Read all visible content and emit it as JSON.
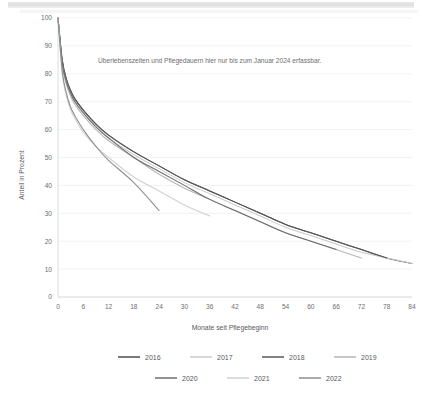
{
  "chart_data": {
    "type": "line",
    "title": "",
    "xlabel": "Monate seit Pflegebeginn",
    "ylabel": "Anteil in Prozent",
    "xlim": [
      0,
      84
    ],
    "ylim": [
      0,
      100
    ],
    "xticks": [
      0,
      6,
      12,
      18,
      24,
      30,
      36,
      42,
      48,
      54,
      60,
      66,
      72,
      78,
      84
    ],
    "yticks": [
      0,
      10,
      20,
      30,
      40,
      50,
      60,
      70,
      80,
      90,
      100
    ],
    "grid": "horizontal",
    "legend_position": "bottom",
    "annotations": [
      {
        "text": "Überlebenszeiten und Pflegedauern hier nur bis zum Januar 2024 erfassbar.",
        "x": 36,
        "y": 84
      }
    ],
    "x": [
      0,
      1,
      2,
      3,
      4,
      6,
      9,
      12,
      18,
      24,
      30,
      36,
      42,
      48,
      54,
      60,
      66,
      72,
      78,
      84
    ],
    "series": [
      {
        "name": "2016",
        "color": "#4c4c4e",
        "x_end": 84,
        "values": [
          100,
          85,
          78,
          74,
          71,
          67,
          62,
          58,
          52,
          47,
          42,
          38,
          34,
          30,
          26,
          23,
          20,
          17,
          14,
          12
        ]
      },
      {
        "name": "2017",
        "color": "#c9cacb",
        "x_end": 84,
        "values": [
          100,
          84,
          77,
          73,
          70,
          66,
          61,
          57,
          51,
          46,
          41,
          37,
          33,
          29,
          25,
          22,
          19,
          16,
          14,
          12
        ]
      },
      {
        "name": "2018",
        "color": "#58595b",
        "x_end": 78,
        "values": [
          100,
          85,
          78,
          74,
          71,
          67,
          62,
          58,
          52,
          47,
          42,
          38,
          34,
          30,
          26,
          23,
          20,
          17,
          14,
          null
        ]
      },
      {
        "name": "2019",
        "color": "#b5b6b8",
        "x_end": 72,
        "values": [
          100,
          83,
          76,
          72,
          69,
          65,
          60,
          56,
          50,
          44,
          39,
          35,
          31,
          27,
          23,
          20,
          17,
          14,
          null,
          null
        ]
      },
      {
        "name": "2020",
        "color": "#6d6e70",
        "x_end": 66,
        "values": [
          100,
          84,
          77,
          73,
          70,
          66,
          61,
          57,
          50,
          45,
          40,
          35,
          31,
          27,
          23,
          20,
          17,
          null,
          null,
          null
        ]
      },
      {
        "name": "2021",
        "color": "#d0d1d2",
        "x_end": 36,
        "values": [
          100,
          80,
          72,
          67,
          64,
          59,
          54,
          50,
          43,
          38,
          33,
          29,
          null,
          null,
          null,
          null,
          null,
          null,
          null,
          null
        ]
      },
      {
        "name": "2022",
        "color": "#8c8d8f",
        "x_end": 24,
        "values": [
          100,
          81,
          73,
          68,
          65,
          60,
          54,
          49,
          41,
          31,
          null,
          null,
          null,
          null,
          null,
          null,
          null,
          null,
          null,
          null
        ]
      }
    ]
  },
  "legend": {
    "row1": [
      "2016",
      "2017",
      "2018",
      "2019"
    ],
    "row2": [
      "2020",
      "2021",
      "2022"
    ]
  }
}
